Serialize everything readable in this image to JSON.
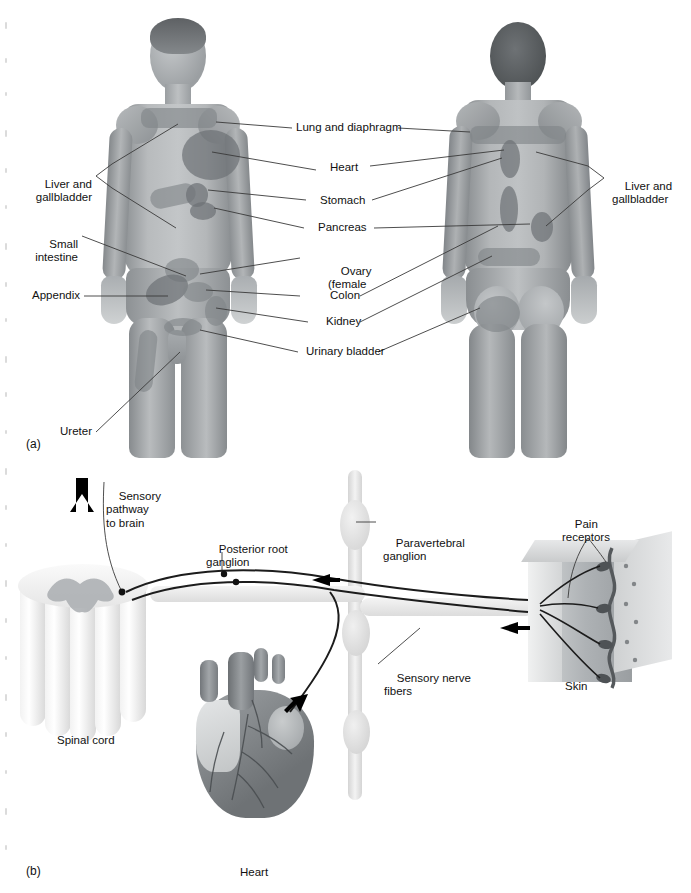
{
  "figure": {
    "panels": [
      {
        "id": "a",
        "label": "(a)"
      },
      {
        "id": "b",
        "label": "(b)"
      }
    ]
  },
  "panel_a": {
    "label": "(a)",
    "views": [
      "anterior",
      "posterior"
    ],
    "labels_left": [
      {
        "name": "liver-gallbladder",
        "text": "Liver and\ngallbladder",
        "line1": "Liver and",
        "line2": "gallbladder"
      },
      {
        "name": "small-intestine",
        "text": "Small\nintestine",
        "line1": "Small",
        "line2": "intestine"
      },
      {
        "name": "appendix",
        "text": "Appendix"
      },
      {
        "name": "ureter",
        "text": "Ureter"
      }
    ],
    "labels_center": [
      {
        "name": "lung-diaphragm",
        "text": "Lung and diaphragm"
      },
      {
        "name": "heart",
        "text": "Heart"
      },
      {
        "name": "stomach",
        "text": "Stomach"
      },
      {
        "name": "pancreas",
        "text": "Pancreas"
      },
      {
        "name": "ovary",
        "line1": "Ovary",
        "line2": "(female"
      },
      {
        "name": "colon",
        "text": "Colon"
      },
      {
        "name": "kidney",
        "text": "Kidney"
      },
      {
        "name": "urinary-bladder",
        "text": "Urinary bladder"
      }
    ],
    "labels_right": [
      {
        "name": "liver-gallbladder-right",
        "line1": "Liver and",
        "line2": "gallbladder"
      }
    ]
  },
  "panel_b": {
    "label": "(b)",
    "labels": [
      {
        "name": "sensory-pathway-to-brain",
        "line1": "Sensory",
        "line2": "pathway",
        "line3": "to brain"
      },
      {
        "name": "posterior-root-ganglion",
        "line1": "Posterior root",
        "line2": "ganglion"
      },
      {
        "name": "paravertebral-ganglion",
        "line1": "Paravertebral",
        "line2": "ganglion"
      },
      {
        "name": "pain-receptors",
        "line1": "Pain",
        "line2": "receptors"
      },
      {
        "name": "sensory-nerve-fibers",
        "line1": "Sensory nerve",
        "line2": "fibers"
      },
      {
        "name": "skin",
        "text": "Skin"
      },
      {
        "name": "spinal-cord",
        "text": "Spinal cord"
      },
      {
        "name": "heart",
        "text": "Heart"
      }
    ]
  },
  "colors": {
    "page_background": "#ffffff",
    "ink": "#111111",
    "leader_line": "#3a3a3a",
    "body_tone": "#a9adb0",
    "referred_zone": "#7f8488",
    "arrow": "#000000"
  }
}
